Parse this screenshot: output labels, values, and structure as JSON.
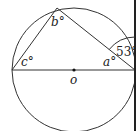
{
  "diagram": {
    "type": "circle-geometry",
    "circle": {
      "center_label": "o",
      "cx": 74,
      "cy": 70,
      "r": 62
    },
    "points": {
      "left": {
        "x": 12,
        "y": 70
      },
      "top": {
        "x": 57,
        "y": 8
      },
      "right": {
        "x": 135,
        "y": 70
      },
      "center": {
        "x": 74,
        "y": 70
      }
    },
    "labels": {
      "a": "a°",
      "b": "b°",
      "c": "c°",
      "o": "o",
      "angle_given": "53°"
    },
    "tangent_line": {
      "x": 135,
      "y1": 0,
      "y2": 131
    },
    "given_angle_value": 53,
    "colors": {
      "stroke": "#333333",
      "text": "#222222",
      "background": "#ffffff"
    }
  }
}
